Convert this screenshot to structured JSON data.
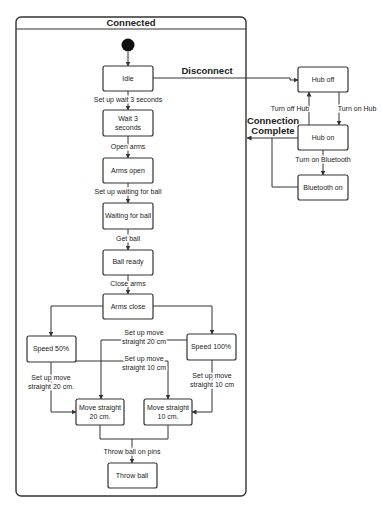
{
  "diagram": {
    "composite_state": {
      "title": "Connected"
    },
    "states": {
      "idle": "Idle",
      "wait_3_seconds": [
        "Wait 3",
        "seconds"
      ],
      "arms_open": "Arms open",
      "waiting_for_ball": "Waiting for ball",
      "ball_ready": "Ball ready",
      "arms_close": "Arms close",
      "speed_50": "Speed 50%",
      "speed_100": "Speed 100%",
      "move_straight_20": [
        "Move straight",
        "20 cm."
      ],
      "move_straight_10": [
        "Move straight",
        "10 cm."
      ],
      "throw_ball": "Throw ball",
      "hub_off": "Hub off",
      "hub_on": "Hub on",
      "bluetooth_on": "Bluetooth on"
    },
    "transitions": {
      "set_up_wait": "Set up wait 3 seconds",
      "open_arms": "Open arms",
      "set_up_waiting": "Set up waiting for ball",
      "get_ball": "Get ball",
      "close_arms": "Close arms",
      "set_up_move_20_mid": [
        "Set up move",
        "straight 20 cm"
      ],
      "set_up_move_10_mid": [
        "Set up move",
        "straight 10 cm"
      ],
      "set_up_move_20_left": [
        "Set up move",
        "straight 20 cm."
      ],
      "set_up_move_10_right": [
        "Set up move",
        "straight 10 cm"
      ],
      "throw_ball_on_pins": "Throw ball on pins",
      "disconnect": "Disconnect",
      "turn_off_hub": "Turn off Hub",
      "turn_on_hub": "Turn on Hub",
      "turn_on_bluetooth": "Turn on Bluetooth",
      "connection_complete": [
        "Connection",
        "Complete"
      ]
    }
  }
}
